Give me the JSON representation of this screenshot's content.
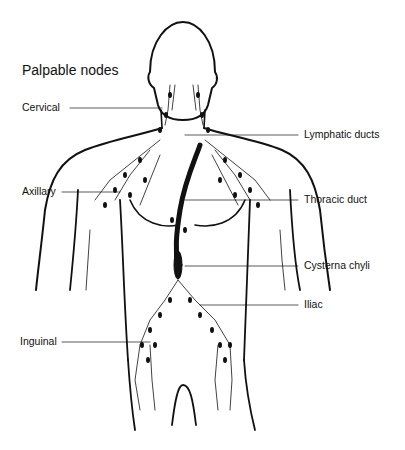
{
  "figure": {
    "title": "Palpable nodes",
    "labels": {
      "cervical": "Cervical",
      "axillary": "Axillary",
      "inguinal": "Inguinal",
      "lymphatic_ducts": "Lymphatic ducts",
      "thoracic_duct": "Thoracic duct",
      "cysterna_chyli": "Cysterna chyli",
      "iliac": "Iliac"
    }
  }
}
